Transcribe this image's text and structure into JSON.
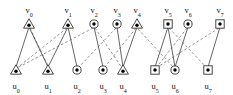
{
  "diagram": {
    "width": 233,
    "height": 95,
    "colors": {
      "background": "#ffffff",
      "solid_edge": "#555555",
      "dashed_edge": "#777777",
      "node_stroke": "#333333",
      "node_fill": "#ffffff",
      "node_dot": "#000000",
      "label_text": "#111111"
    },
    "top_nodes": [
      {
        "id": "v0",
        "name": "v",
        "sub": "0",
        "shape": "triangle",
        "x": 29,
        "y": 24,
        "label_x": 29,
        "label_y": 13
      },
      {
        "id": "v1",
        "name": "v",
        "sub": "1",
        "shape": "triangle",
        "x": 68,
        "y": 24,
        "label_x": 68,
        "label_y": 13
      },
      {
        "id": "v2",
        "name": "v",
        "sub": "2",
        "shape": "circle",
        "x": 94,
        "y": 24,
        "label_x": 94,
        "label_y": 13
      },
      {
        "id": "v3",
        "name": "v",
        "sub": "3",
        "shape": "circle",
        "x": 117,
        "y": 24,
        "label_x": 117,
        "label_y": 13
      },
      {
        "id": "v4",
        "name": "v",
        "sub": "4",
        "shape": "triangle",
        "x": 137,
        "y": 24,
        "label_x": 137,
        "label_y": 13
      },
      {
        "id": "v5",
        "name": "v",
        "sub": "5",
        "shape": "square",
        "x": 168,
        "y": 24,
        "label_x": 168,
        "label_y": 13
      },
      {
        "id": "v6",
        "name": "v",
        "sub": "6",
        "shape": "circle",
        "x": 188,
        "y": 24,
        "label_x": 188,
        "label_y": 13
      },
      {
        "id": "v7",
        "name": "v",
        "sub": "7",
        "shape": "square",
        "x": 220,
        "y": 24,
        "label_x": 220,
        "label_y": 13
      }
    ],
    "bottom_nodes": [
      {
        "id": "u0",
        "name": "u",
        "sub": "0",
        "shape": "triangle",
        "x": 16,
        "y": 70,
        "label_x": 16,
        "label_y": 89
      },
      {
        "id": "u1",
        "name": "u",
        "sub": "1",
        "shape": "triangle",
        "x": 48,
        "y": 70,
        "label_x": 48,
        "label_y": 89
      },
      {
        "id": "u2",
        "name": "u",
        "sub": "2",
        "shape": "circle",
        "x": 77,
        "y": 70,
        "label_x": 77,
        "label_y": 89
      },
      {
        "id": "u3",
        "name": "u",
        "sub": "3",
        "shape": "circle",
        "x": 103,
        "y": 70,
        "label_x": 103,
        "label_y": 89
      },
      {
        "id": "u4",
        "name": "u",
        "sub": "4",
        "shape": "triangle",
        "x": 123,
        "y": 70,
        "label_x": 123,
        "label_y": 89
      },
      {
        "id": "u5",
        "name": "u",
        "sub": "5",
        "shape": "square",
        "x": 155,
        "y": 70,
        "label_x": 155,
        "label_y": 89
      },
      {
        "id": "u6",
        "name": "u",
        "sub": "6",
        "shape": "circle",
        "x": 175,
        "y": 70,
        "label_x": 175,
        "label_y": 89
      },
      {
        "id": "u7",
        "name": "u",
        "sub": "7",
        "shape": "square",
        "x": 208,
        "y": 70,
        "label_x": 208,
        "label_y": 89
      }
    ],
    "solid_edges": [
      {
        "from": "v0",
        "to": "u0",
        "x1": 29,
        "y1": 27,
        "x2": 16,
        "y2": 67
      },
      {
        "from": "v0",
        "to": "u1",
        "x1": 29,
        "y1": 27,
        "x2": 48,
        "y2": 67
      },
      {
        "from": "v1",
        "to": "u1",
        "x1": 68,
        "y1": 27,
        "x2": 48,
        "y2": 67
      },
      {
        "from": "v1",
        "to": "u2",
        "x1": 68,
        "y1": 27,
        "x2": 77,
        "y2": 67
      },
      {
        "from": "v2",
        "to": "u3",
        "x1": 94,
        "y1": 27,
        "x2": 103,
        "y2": 67
      },
      {
        "from": "v3",
        "to": "u4",
        "x1": 117,
        "y1": 27,
        "x2": 123,
        "y2": 67
      },
      {
        "from": "v4",
        "to": "u4",
        "x1": 137,
        "y1": 27,
        "x2": 123,
        "y2": 67
      },
      {
        "from": "v5",
        "to": "u5",
        "x1": 168,
        "y1": 27,
        "x2": 155,
        "y2": 67
      },
      {
        "from": "v5",
        "to": "u6",
        "x1": 168,
        "y1": 27,
        "x2": 175,
        "y2": 67
      },
      {
        "from": "v6",
        "to": "u6",
        "x1": 188,
        "y1": 27,
        "x2": 175,
        "y2": 67
      },
      {
        "from": "v7",
        "to": "u7",
        "x1": 220,
        "y1": 27,
        "x2": 208,
        "y2": 67
      }
    ],
    "dashed_edges": [
      {
        "from": "v0",
        "to": "u1",
        "x1": 30,
        "y1": 28,
        "x2": 49,
        "y2": 68
      },
      {
        "from": "v1",
        "to": "u0",
        "x1": 67,
        "y1": 28,
        "x2": 17,
        "y2": 68
      },
      {
        "from": "v2",
        "to": "u0",
        "x1": 93,
        "y1": 28,
        "x2": 17,
        "y2": 68
      },
      {
        "from": "v2",
        "to": "u4",
        "x1": 95,
        "y1": 28,
        "x2": 122,
        "y2": 68
      },
      {
        "from": "v3",
        "to": "u2",
        "x1": 116,
        "y1": 28,
        "x2": 78,
        "y2": 68
      },
      {
        "from": "v4",
        "to": "u3",
        "x1": 136,
        "y1": 28,
        "x2": 104,
        "y2": 68
      },
      {
        "from": "v5",
        "to": "u7",
        "x1": 169,
        "y1": 28,
        "x2": 207,
        "y2": 68
      },
      {
        "from": "v6",
        "to": "u5",
        "x1": 187,
        "y1": 28,
        "x2": 156,
        "y2": 68
      },
      {
        "from": "v7",
        "to": "u5",
        "x1": 219,
        "y1": 28,
        "x2": 156,
        "y2": 68
      },
      {
        "from": "v4",
        "to": "u6",
        "x1": 138,
        "y1": 29,
        "x2": 174,
        "y2": 68
      }
    ]
  }
}
